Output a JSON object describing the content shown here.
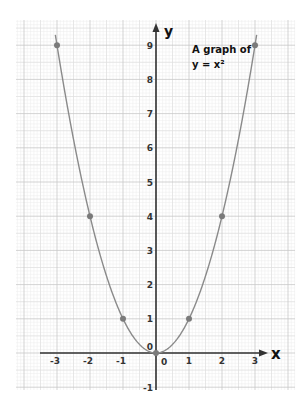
{
  "chart_data": {
    "type": "line",
    "title": "A graph of",
    "subtitle": "y = x²",
    "xlabel": "x",
    "ylabel": "y",
    "x": [
      -3,
      -2,
      -1,
      0,
      1,
      2,
      3
    ],
    "series": [
      {
        "name": "y = x^2",
        "values": [
          9,
          4,
          1,
          0,
          1,
          4,
          9
        ],
        "style": "smooth curve with point markers"
      }
    ],
    "xticks": [
      "-3",
      "-2",
      "-1",
      "0",
      "1",
      "2",
      "3"
    ],
    "yticks": [
      "-1",
      "1",
      "2",
      "3",
      "4",
      "5",
      "6",
      "7",
      "8",
      "9"
    ],
    "origin_label": "0",
    "xlim": [
      -3.5,
      3.5
    ],
    "ylim": [
      -1,
      9.5
    ],
    "grid": true,
    "grid_style": "graph paper, major every 1 unit, minor every 0.1 unit",
    "colors": {
      "curve": "#8a8a8a",
      "points": "#7a7a7a",
      "axis": "#333333",
      "major_grid": "#c8c8c8",
      "minor_grid": "#ececec"
    }
  }
}
